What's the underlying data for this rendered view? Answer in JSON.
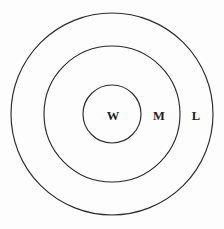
{
  "figure": {
    "type": "nested-circles-venn",
    "background_color": "#fdfdfd",
    "stroke_color": "#2b2b2b",
    "text_color": "#1c1c1c"
  },
  "chart_data": {
    "type": "diagram",
    "title": "",
    "subtitle": "",
    "xlabel": "",
    "ylabel": "",
    "grid": false,
    "legend_position": "none",
    "center": {
      "x": 112,
      "y": 114
    },
    "rings": [
      {
        "id": "outer",
        "label": "L",
        "radius": 101,
        "label_x": 196,
        "label_y": 116
      },
      {
        "id": "middle",
        "label": "M",
        "radius": 68,
        "label_x": 159,
        "label_y": 116
      },
      {
        "id": "inner",
        "label": "W",
        "radius": 29,
        "label_x": 113,
        "label_y": 116
      }
    ],
    "labels": [
      "W",
      "M",
      "L"
    ]
  }
}
